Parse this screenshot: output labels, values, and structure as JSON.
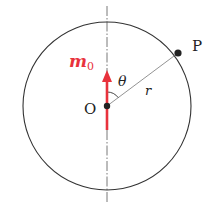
{
  "diagram": {
    "type": "geometry",
    "colors": {
      "circle": "#333333",
      "vector": "#e8323c",
      "axis": "#555555",
      "radius_line": "#777777",
      "points": "#222222"
    },
    "labels": {
      "center": "O",
      "point": "P",
      "radius": "r",
      "angle": "θ",
      "vector_main": "m",
      "vector_sub": "0"
    },
    "elements": {
      "circle": {
        "cx": 107,
        "cy": 106,
        "r": 84
      },
      "axis": {
        "x": 107,
        "y1": 6,
        "y2": 203,
        "style": "dash-dot"
      },
      "vector": {
        "x": 107,
        "y_tail": 130,
        "y_head": 70
      },
      "point_P": {
        "x": 178,
        "y": 53
      },
      "point_O": {
        "x": 107,
        "y": 106
      }
    }
  }
}
